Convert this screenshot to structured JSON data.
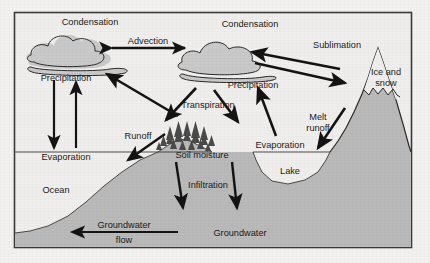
{
  "diagram": {
    "type": "schematic-cross-section",
    "frame": {
      "x": 14,
      "y": 12,
      "width": 398,
      "height": 236,
      "border_color": "#3a3a3a"
    },
    "colors": {
      "page_background": "#f2f1ef",
      "panel_background": "#efeeec",
      "ink": "#1a1a1a",
      "land_fill": "#b9b9b9",
      "water_fill": "#dcdcdc",
      "cloud_fill": "#c9c9c9",
      "cloud_outline": "#2a2a2a",
      "arrow": "#141414"
    }
  },
  "labels": {
    "condensation_left": "Condensation",
    "condensation_right": "Condensation",
    "advection": "Advection",
    "sublimation": "Sublimation",
    "precipitation_left": "Precipitation",
    "precipitation_right": "Precipitation",
    "ice_and_snow_line1": "Ice and",
    "ice_and_snow_line2": "snow",
    "transpiration": "Transpiration",
    "runoff": "Runoff",
    "soil_moisture": "Soil moisture",
    "melt_runoff_line1": "Melt",
    "melt_runoff_line2": "runoff",
    "evaporation_ocean": "Evaporation",
    "evaporation_lake": "Evaporation",
    "lake": "Lake",
    "ocean": "Ocean",
    "infiltration": "Infiltration",
    "groundwater": "Groundwater",
    "groundwater_flow_line1": "Groundwater",
    "groundwater_flow_line2": "flow"
  },
  "processes": [
    {
      "name": "advection",
      "label": "Advection",
      "direction": "bidirectional-horizontal",
      "between": [
        "condensation-left-cloud",
        "condensation-right-cloud"
      ]
    },
    {
      "name": "sublimation",
      "label": "Sublimation",
      "direction": "mountain-to-cloud",
      "between": [
        "ice-and-snow",
        "condensation-right-cloud"
      ]
    },
    {
      "name": "snowfall",
      "label": "",
      "direction": "cloud-to-mountain",
      "between": [
        "condensation-right-cloud",
        "ice-and-snow"
      ]
    },
    {
      "name": "precipitation-ocean",
      "label": "Precipitation",
      "direction": "down",
      "between": [
        "condensation-left-cloud",
        "ocean"
      ]
    },
    {
      "name": "evaporation-ocean",
      "label": "Evaporation",
      "direction": "up",
      "between": [
        "ocean",
        "condensation-left-cloud"
      ]
    },
    {
      "name": "transpiration",
      "label": "Transpiration",
      "direction": "up-left",
      "between": [
        "forest",
        "condensation-left-cloud"
      ]
    },
    {
      "name": "runoff",
      "label": "Runoff",
      "direction": "down-left",
      "between": [
        "hillslope",
        "ocean"
      ]
    },
    {
      "name": "precipitation-land",
      "label": "Precipitation",
      "direction": "down-left",
      "between": [
        "condensation-right-cloud",
        "soil-moisture"
      ]
    },
    {
      "name": "evaporation-lake",
      "label": "Evaporation",
      "direction": "up",
      "between": [
        "lake",
        "condensation-right-cloud"
      ]
    },
    {
      "name": "melt-runoff",
      "label": "Melt runoff",
      "direction": "down-left",
      "between": [
        "ice-and-snow",
        "lake"
      ]
    },
    {
      "name": "infiltration-left",
      "label": "Infiltration",
      "direction": "down",
      "between": [
        "soil-moisture",
        "groundwater"
      ]
    },
    {
      "name": "infiltration-right",
      "label": "Infiltration",
      "direction": "down",
      "between": [
        "soil-moisture",
        "groundwater"
      ]
    },
    {
      "name": "groundwater-flow",
      "label": "Groundwater flow",
      "direction": "left",
      "between": [
        "groundwater",
        "ocean"
      ]
    }
  ]
}
